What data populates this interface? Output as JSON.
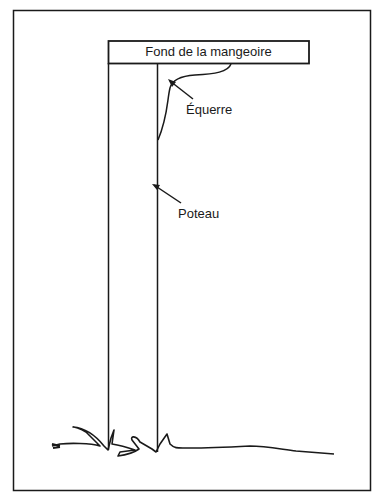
{
  "diagram": {
    "box_label": "Fond de la mangeoire",
    "labels": [
      {
        "text": "Équerre"
      },
      {
        "text": "Poteau"
      }
    ],
    "colors": {
      "ink": "#1a1a1a",
      "background": "#ffffff"
    }
  }
}
